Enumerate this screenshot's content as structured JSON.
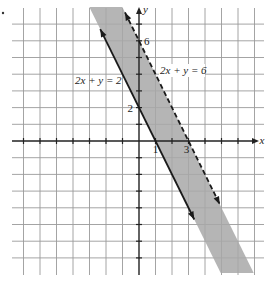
{
  "chart_data": {
    "type": "line",
    "title": "",
    "xlabel": "x",
    "ylabel": "y",
    "xlim": [
      -8,
      7
    ],
    "ylim": [
      -8,
      8
    ],
    "grid": true,
    "grid_step": 1,
    "x_tick_labels": [
      {
        "value": 1,
        "text": "1"
      },
      {
        "value": 3,
        "text": "3"
      }
    ],
    "y_tick_labels": [
      {
        "value": 6,
        "text": "6"
      },
      {
        "value": 2,
        "text": "2"
      }
    ],
    "series": [
      {
        "name": "2x + y = 2",
        "style": "solid",
        "a": 2,
        "b": 1,
        "c": 2,
        "x_intercept": 1,
        "y_intercept": 2,
        "x_range": [
          -2.35,
          3.35
        ]
      },
      {
        "name": "2x + y = 6",
        "style": "dashed",
        "a": 2,
        "b": 1,
        "c": 6,
        "x_intercept": 3,
        "y_intercept": 6,
        "x_range": [
          -0.85,
          4.9
        ]
      }
    ],
    "shaded_region": {
      "description": "2 <= 2x + y < 6",
      "lower": 2,
      "upper": 6,
      "color": "#a8a8a8"
    },
    "annotations": [
      {
        "text": "2x + y = 2",
        "at": [
          -1.6,
          3.7
        ]
      },
      {
        "text": "2x + y = 6",
        "at": [
          2.4,
          4.2
        ]
      }
    ]
  }
}
